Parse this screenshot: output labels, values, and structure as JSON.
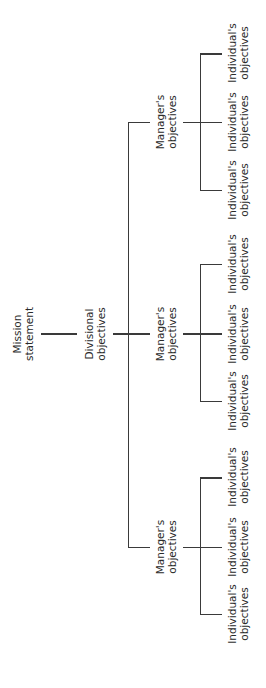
{
  "diagram": {
    "type": "hierarchy",
    "orientation": "rotated-90",
    "root": {
      "label_line1": "Mission",
      "label_line2": "statement"
    },
    "division": {
      "label_line1": "Divisional",
      "label_line2": "objectives"
    },
    "managers": [
      {
        "label_line1": "Manager's",
        "label_line2": "objectives",
        "individuals": [
          {
            "label_line1": "Individual's",
            "label_line2": "objectives"
          },
          {
            "label_line1": "Individual's",
            "label_line2": "objectives"
          },
          {
            "label_line1": "Individual's",
            "label_line2": "objectives"
          }
        ]
      },
      {
        "label_line1": "Manager's",
        "label_line2": "objectives",
        "individuals": [
          {
            "label_line1": "Individual's",
            "label_line2": "objectives"
          },
          {
            "label_line1": "Individual's",
            "label_line2": "objectives"
          },
          {
            "label_line1": "Individual's",
            "label_line2": "objectives"
          }
        ]
      },
      {
        "label_line1": "Manager's",
        "label_line2": "objectives",
        "individuals": [
          {
            "label_line1": "Individual's",
            "label_line2": "objectives"
          },
          {
            "label_line1": "Individual's",
            "label_line2": "objectives"
          },
          {
            "label_line1": "Individual's",
            "label_line2": "objectives"
          }
        ]
      }
    ],
    "colors": {
      "line": "#3a3a3a",
      "text": "#2a2a2a",
      "background": "#ffffff"
    }
  }
}
